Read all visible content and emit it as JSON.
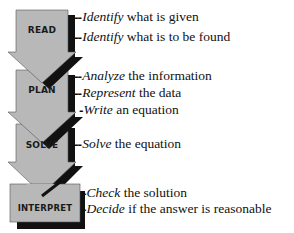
{
  "diagram": {
    "colors": {
      "fill": "#b8b8b8",
      "shadow": "#111111",
      "text": "#111111"
    },
    "stages": [
      {
        "label": "READ",
        "steps": [
          {
            "verb": "Identify",
            "rest": " what is given"
          },
          {
            "verb": "Identify",
            "rest": " what is to be found"
          }
        ]
      },
      {
        "label": "PLAN",
        "steps": [
          {
            "verb": "Analyze",
            "rest": " the information"
          },
          {
            "verb": "Represent",
            "rest": " the data"
          },
          {
            "verb": "Write",
            "rest": " an equation"
          }
        ]
      },
      {
        "label": "SOLVE",
        "steps": [
          {
            "verb": "Solve",
            "rest": " the equation"
          }
        ]
      },
      {
        "label": "INTERPRET",
        "steps": [
          {
            "verb": "Check",
            "rest": " the solution"
          },
          {
            "verb": "Decide",
            "rest": " if the answer is reasonable"
          }
        ]
      }
    ]
  }
}
